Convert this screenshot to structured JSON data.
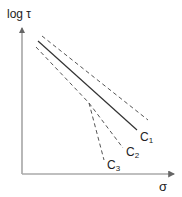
{
  "figure": {
    "y_axis_label": "log τ",
    "x_axis_label": "σ",
    "curves": [
      {
        "name": "C",
        "sub": "1",
        "style": "solid"
      },
      {
        "name": "C",
        "sub": "2",
        "style": "dashed"
      },
      {
        "name": "C",
        "sub": "3",
        "style": "dashed"
      }
    ],
    "colors": {
      "line": "#333333",
      "dashed": "#555555",
      "axis": "#888888"
    }
  }
}
